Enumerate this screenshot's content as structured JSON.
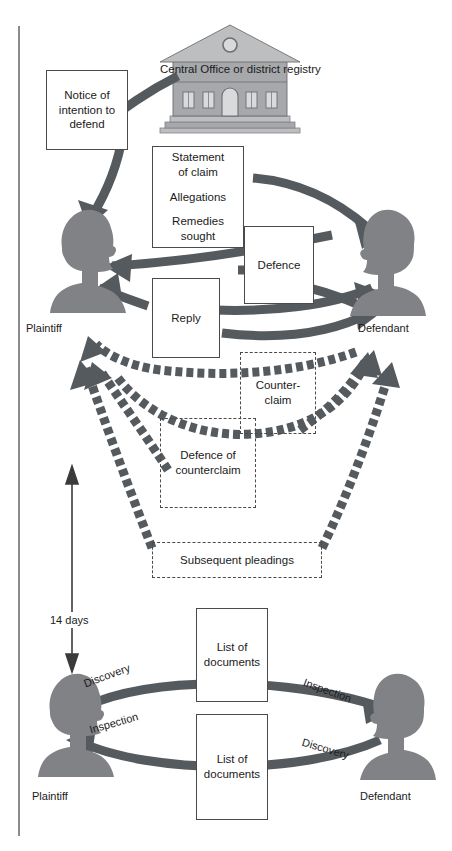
{
  "diagram": {
    "colors": {
      "arrow_solid": "#555a5e",
      "arrow_dashed": "#555a5e",
      "silhouette": "#808285",
      "building_fill": "#a6a8ab",
      "building_roof": "#bcbec0",
      "box_border": "#4a4a4a",
      "text": "#1b1b1b",
      "page_rule": "#6d6e71"
    },
    "court": {
      "name": "court-building",
      "line1": "Central Office",
      "line2": "or district registry"
    },
    "parties": {
      "top_left": "Plaintiff",
      "top_right": "Defendant",
      "bottom_left": "Plaintiff",
      "bottom_right": "Defendant"
    },
    "boxes": [
      {
        "id": "notice",
        "lines": [
          "Notice of",
          "intention to",
          "defend"
        ],
        "style": "solid"
      },
      {
        "id": "statement-of-claim",
        "groups": [
          [
            "Statement",
            "of claim"
          ],
          [
            "Allegations"
          ],
          [
            "Remedies",
            "sought"
          ]
        ],
        "style": "solid"
      },
      {
        "id": "defence",
        "lines": [
          "Defence"
        ],
        "style": "solid"
      },
      {
        "id": "reply",
        "lines": [
          "Reply"
        ],
        "style": "solid"
      },
      {
        "id": "counterclaim",
        "lines": [
          "Counter-",
          "claim"
        ],
        "style": "dashed"
      },
      {
        "id": "defence-of-counterclaim",
        "lines": [
          "Defence of",
          "counterclaim"
        ],
        "style": "dashed"
      },
      {
        "id": "subsequent-pleadings",
        "lines": [
          "Subsequent pleadings"
        ],
        "style": "dashed"
      },
      {
        "id": "list-of-documents-top",
        "lines": [
          "List of",
          "documents"
        ],
        "style": "solid"
      },
      {
        "id": "list-of-documents-bottom",
        "lines": [
          "List of",
          "documents"
        ],
        "style": "solid"
      }
    ],
    "timing": {
      "label": "14 days",
      "arrow": "double-headed-vertical-arrow"
    },
    "discovery": {
      "top_left_label": "Discovery",
      "top_right_label": "Inspection",
      "bottom_left_label": "Inspection",
      "bottom_right_label": "Discovery"
    }
  }
}
